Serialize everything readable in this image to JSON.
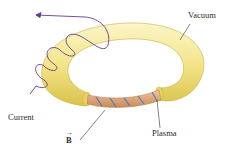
{
  "diagram": {
    "type": "tokamak-torus",
    "labels": {
      "vacuum": "Vacuum",
      "current": "Current",
      "plasma": "Plasma",
      "field": "B"
    },
    "colors": {
      "torus": "#f3e58a",
      "torus_shadow": "#d9c24a",
      "torus_highlight": "#fbf5c8",
      "plasma": "#e2a77a",
      "field_lines": "#4a7fc0",
      "coil": "#6a3a8a",
      "leader": "#333333"
    }
  }
}
